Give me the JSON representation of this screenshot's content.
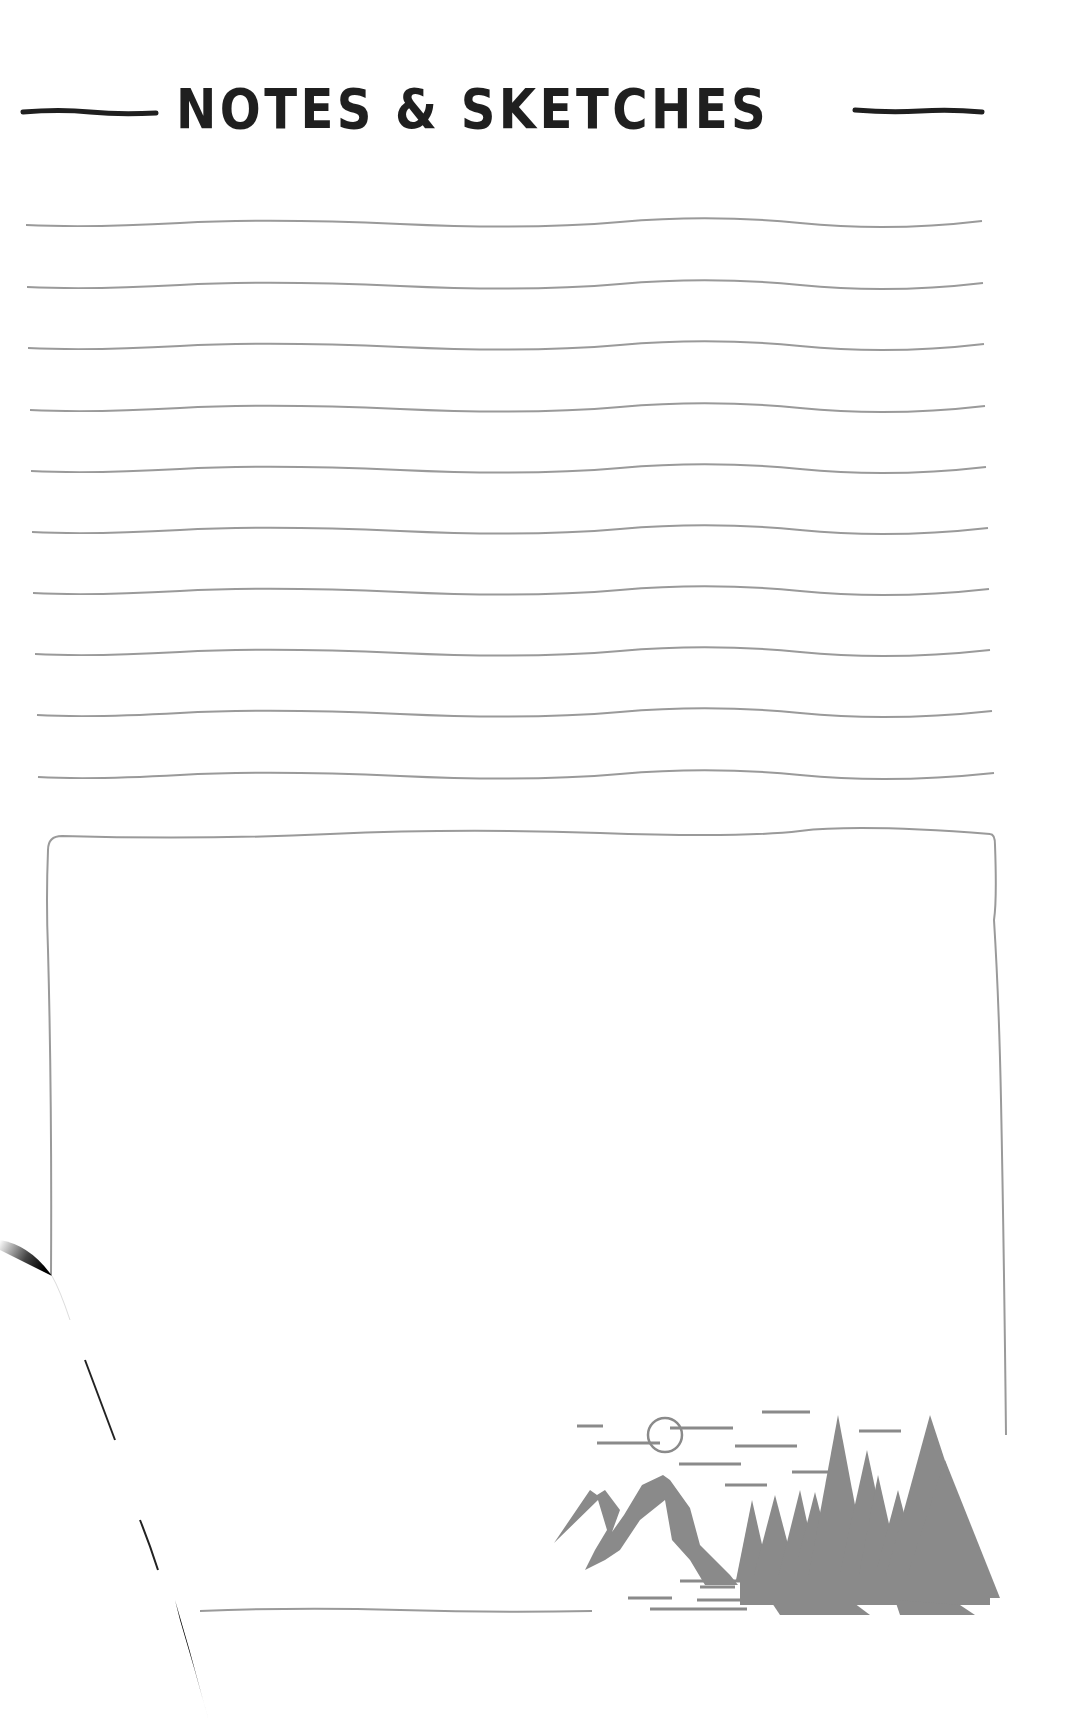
{
  "page": {
    "title": "NOTES & SKETCHES",
    "background_color": "#ffffff",
    "ink_color": "#1f1f1f",
    "rule_color": "#9a9a9a"
  },
  "ruled_lines": {
    "count": 10,
    "y_positions": [
      224,
      286,
      347,
      409,
      470,
      531,
      592,
      653,
      714,
      776
    ],
    "x_start": 26,
    "x_end": 990
  },
  "sketch_box": {
    "top": 836,
    "left": 51,
    "right": 1007,
    "right_edge_bottom": 1435,
    "left_edge_bottom": 1275,
    "bottom_line_y": 1610
  },
  "illustration": {
    "name": "mountain-forest-scene",
    "elements": [
      "moon",
      "clouds",
      "mountains",
      "pine-forest"
    ],
    "color": "#8a8a8a"
  },
  "page_curl": {
    "present": true,
    "corner": "bottom-left"
  }
}
